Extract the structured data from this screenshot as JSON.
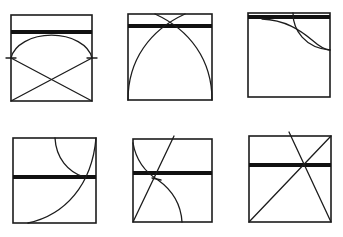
{
  "figure": {
    "panel_count": 6,
    "rows": 2,
    "columns": 3,
    "colors": {
      "ink": "#1c1c1c",
      "background": "#ffffff"
    },
    "panels": [
      {
        "id": "panel-1",
        "elements": [
          "square-frame",
          "thick-horizontal-bar",
          "semicircle-arc",
          "crossed-diagonals",
          "tick-marks"
        ]
      },
      {
        "id": "panel-2",
        "elements": [
          "square-frame",
          "thick-horizontal-bar",
          "two-intersecting-arcs"
        ]
      },
      {
        "id": "panel-3",
        "elements": [
          "square-frame",
          "thick-horizontal-bar",
          "two-quarter-arcs",
          "vertical-tick"
        ]
      },
      {
        "id": "panel-4",
        "elements": [
          "square-frame",
          "thick-horizontal-bar",
          "small-arc",
          "large-arc"
        ]
      },
      {
        "id": "panel-5",
        "elements": [
          "square-frame",
          "thick-horizontal-bar",
          "diagonal-line",
          "s-curve-arc"
        ]
      },
      {
        "id": "panel-6",
        "elements": [
          "square-frame",
          "thick-horizontal-bar",
          "diagonal-line",
          "slanted-line"
        ]
      }
    ]
  }
}
